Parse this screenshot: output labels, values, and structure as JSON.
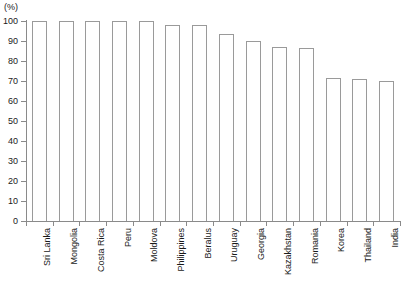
{
  "chart_data": {
    "type": "bar",
    "title": "",
    "subtitle": "",
    "xlabel": "",
    "ylabel": "(%)",
    "unit_label": "(%)",
    "ylim": [
      0,
      100
    ],
    "yticks": [
      0,
      10,
      20,
      30,
      40,
      50,
      60,
      70,
      80,
      90,
      100
    ],
    "ytick_labels": [
      "0",
      "10",
      "20",
      "30",
      "40",
      "50",
      "60",
      "70",
      "80",
      "90",
      "100"
    ],
    "grid": false,
    "legend": null,
    "legend_position": "none",
    "bar_fill_color": "#ffffff",
    "bar_border_color": "#9a9a9a",
    "axis_color": "#8a8a8a",
    "categories": [
      "Sri Lanka",
      "Mongolia",
      "Costa Rica",
      "Peru",
      "Moldova",
      "Philippines",
      "Beralus",
      "Uruguay",
      "Georgia",
      "Kazakhstan",
      "Romania",
      "Korea",
      "Thailand",
      "India"
    ],
    "values": [
      100,
      100,
      100,
      100,
      100,
      98,
      98,
      93.5,
      90,
      87,
      86.5,
      71.5,
      71,
      70
    ]
  }
}
